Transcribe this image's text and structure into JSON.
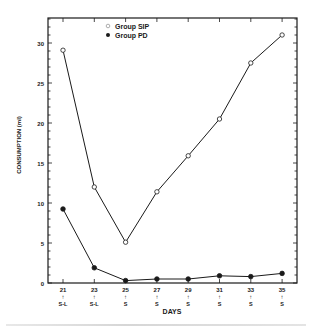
{
  "chart_data": {
    "type": "line",
    "title": "",
    "xlabel": "DAYS",
    "ylabel": "CONSUMPTION (ml)",
    "x": [
      21,
      23,
      25,
      27,
      29,
      31,
      33,
      35
    ],
    "x_tick_labels": [
      "21",
      "23",
      "25",
      "27",
      "29",
      "31",
      "33",
      "35"
    ],
    "x_sub_labels": [
      "S-L",
      "S-L",
      "S",
      "S",
      "S",
      "S",
      "S",
      "S"
    ],
    "x_arrow": "↑",
    "y_ticks": [
      0,
      5,
      10,
      15,
      20,
      25,
      30
    ],
    "ylim": [
      0,
      33
    ],
    "grid": false,
    "legend_position": "upper-left-inside",
    "series": [
      {
        "name": "Group SIP",
        "marker": "open-circle",
        "values": [
          29.1,
          12.0,
          5.1,
          11.4,
          15.9,
          20.5,
          27.5,
          31.0
        ]
      },
      {
        "name": "Group PD",
        "marker": "filled-circle",
        "values": [
          9.25,
          1.9,
          0.3,
          0.5,
          0.5,
          0.9,
          0.8,
          1.2
        ]
      }
    ]
  },
  "colors": {
    "ink": "#1a1a1a",
    "background": "#ffffff"
  }
}
